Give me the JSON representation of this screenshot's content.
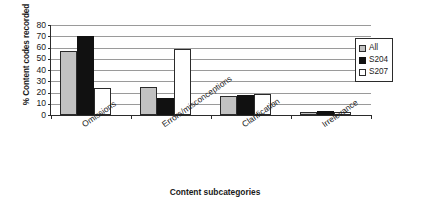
{
  "chart_data": {
    "type": "bar",
    "title": "",
    "xlabel": "Content subcategories",
    "ylabel": "% Content codes recorded",
    "categories": [
      "Omissions",
      "Errors/misconceptions",
      "Clarification",
      "Irrelevance"
    ],
    "series": [
      {
        "name": "All",
        "color": "#c2c2c2",
        "values": [
          57,
          25,
          17,
          3
        ]
      },
      {
        "name": "S204",
        "color": "#111111",
        "values": [
          70,
          15,
          18,
          4
        ]
      },
      {
        "name": "S207",
        "color": "#ffffff",
        "values": [
          24,
          59,
          19,
          3
        ]
      }
    ],
    "ylim": [
      0,
      80
    ],
    "yticks": [
      0,
      10,
      20,
      30,
      40,
      50,
      60,
      70,
      80
    ],
    "ytick_labels": [
      "0",
      "10",
      "20",
      "30",
      "40",
      "50",
      "60",
      "70",
      "80"
    ],
    "grid": true,
    "legend_position": "right",
    "legend_entries": [
      "All",
      "S204",
      "S207"
    ]
  }
}
